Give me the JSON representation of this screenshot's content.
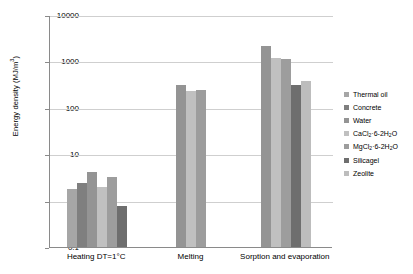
{
  "chart_data": {
    "type": "bar",
    "title": "",
    "xlabel": "",
    "ylabel": "Energy density (MJ/m3)",
    "ylabel_display": "Energy density (MJ/m³)",
    "yscale": "log",
    "ylim": [
      0.1,
      10000
    ],
    "ytick_labels": [
      "10000",
      "1000",
      "100",
      "10",
      "1",
      "0.1"
    ],
    "ytick_values": [
      10000,
      1000,
      100,
      10,
      1,
      0.1
    ],
    "grid": true,
    "legend_position": "right",
    "categories": [
      "Heating DT=1°C",
      "Melting",
      "Sorption and evaporation"
    ],
    "series": [
      {
        "name": "Thermal oil",
        "color": "#a6a6a6",
        "values": [
          1.8,
          null,
          null
        ]
      },
      {
        "name": "Concrete",
        "color": "#7f7f7f",
        "values": [
          2.4,
          null,
          null
        ]
      },
      {
        "name": "Water",
        "color": "#949494",
        "values": [
          4.2,
          310,
          2200
        ]
      },
      {
        "name": "CaCl2 6-2H2O",
        "color": "#c0c0c0",
        "values": [
          2.0,
          225,
          1200
        ]
      },
      {
        "name": "MgCl2 6-2H2O",
        "color": "#9d9d9d",
        "values": [
          3.3,
          245,
          1150
        ]
      },
      {
        "name": "Silicagel",
        "color": "#6e6e6e",
        "values": [
          0.78,
          null,
          310
        ]
      },
      {
        "name": "Zeolite",
        "color": "#bdbdbd",
        "values": [
          null,
          null,
          370
        ]
      }
    ],
    "legend_entries": [
      "Thermal oil",
      "Concrete",
      "Water",
      "CaCl2 6-2H2O",
      "MgCl2 6-2H2O",
      "Silicagel",
      "Zeolite"
    ],
    "legend_entries_display": [
      "Thermal oil",
      "Concrete",
      "Water",
      "CaCl<sub>2</sub>·6-2H<sub>2</sub>O",
      "MgCl<sub>2</sub>·6-2H<sub>2</sub>O",
      "Silicagel",
      "Zeolite"
    ]
  },
  "colors": {
    "axis": "#8a8a8a",
    "grid": "#cfcfcf",
    "background": "#ffffff",
    "text": "#000000"
  }
}
